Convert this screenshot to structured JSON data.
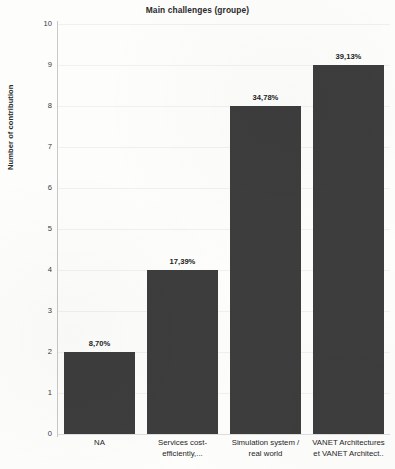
{
  "chart_data": {
    "type": "bar",
    "title": "Main challenges (groupe)",
    "xlabel": "",
    "ylabel": "Number of contribution",
    "ylim": [
      0,
      10
    ],
    "ytick_labels": [
      "10",
      "9",
      "8",
      "7",
      "6",
      "5",
      "4",
      "3",
      "2",
      "1",
      "0"
    ],
    "yticks": [
      10,
      9,
      8,
      7,
      6,
      5,
      4,
      3,
      2,
      1,
      0
    ],
    "grid": true,
    "legend": false,
    "bar_color": "#3d3d3d",
    "categories": [
      "NA",
      "Services cost-efficiently,...",
      "Simulation system / real world",
      "VANET Architectures et VANET Architect.."
    ],
    "category_lines": [
      [
        "NA"
      ],
      [
        "Services cost-",
        "efficiently,..."
      ],
      [
        "Simulation system /",
        "real world"
      ],
      [
        "VANET Architectures",
        "et VANET Architect.."
      ]
    ],
    "values": [
      2,
      4,
      8,
      9
    ],
    "data_labels": [
      "8,70%",
      "17,39%",
      "34,78%",
      "39,13%"
    ]
  }
}
